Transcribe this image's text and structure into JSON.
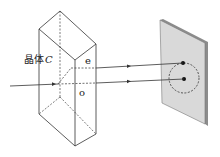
{
  "diagram": {
    "crystal_label": "晶体",
    "crystal_symbol": "C",
    "ray_labels": {
      "extraordinary": "e",
      "ordinary": "o"
    },
    "colors": {
      "line": "#333333",
      "screen_fill": "#d9d9d9",
      "screen_edge": "#8c8c8c",
      "dot": "#111111"
    }
  }
}
